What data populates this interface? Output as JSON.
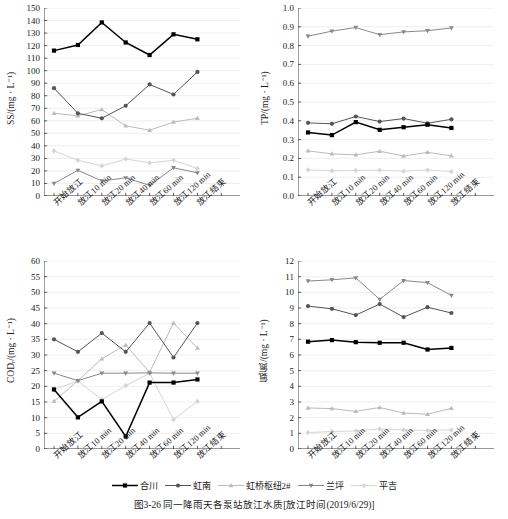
{
  "figure": {
    "caption": "图3-26  同一降雨天各泵站放江水质[放江时间(2019/6/29)]"
  },
  "legend": {
    "position": "bottom",
    "items": [
      {
        "label": "合川",
        "color": "#000000",
        "marker": "square"
      },
      {
        "label": "虹南",
        "color": "#555555",
        "marker": "circle"
      },
      {
        "label": "虹桥枢纽2#",
        "color": "#bbbbbb",
        "marker": "triangle-up"
      },
      {
        "label": "兰坪",
        "color": "#888888",
        "marker": "triangle-down"
      },
      {
        "label": "平吉",
        "color": "#d5d5d5",
        "marker": "diamond"
      }
    ]
  },
  "categories": [
    "开始放江",
    "放江10 min",
    "放江20 min",
    "放江40 min",
    "放江60 min",
    "放江120 min",
    "放江结束"
  ],
  "chart_data": [
    {
      "id": "ss",
      "type": "line",
      "title": "",
      "xlabel": "",
      "ylabel": "SS/(mg · L⁻¹)",
      "ylim": [
        0,
        150
      ],
      "yticks": [
        0,
        10,
        20,
        30,
        40,
        50,
        60,
        70,
        80,
        90,
        100,
        110,
        120,
        130,
        140,
        150
      ],
      "grid": true,
      "categories": [
        "开始放江",
        "放江10 min",
        "放江20 min",
        "放江40 min",
        "放江60 min",
        "放江120 min",
        "放江结束"
      ],
      "series": [
        {
          "name": "合川",
          "color": "#000000",
          "marker": "square",
          "values": [
            116,
            120.5,
            138.5,
            122.5,
            112.5,
            129,
            125
          ]
        },
        {
          "name": "虹南",
          "color": "#555555",
          "marker": "circle",
          "values": [
            86,
            66,
            62,
            72,
            89,
            81,
            99
          ]
        },
        {
          "name": "虹桥枢纽2#",
          "color": "#bbbbbb",
          "marker": "triangle-up",
          "values": [
            66,
            64,
            69,
            56,
            52.5,
            59,
            62
          ]
        },
        {
          "name": "兰坪",
          "color": "#888888",
          "marker": "triangle-down",
          "values": [
            10,
            20.5,
            12,
            14.5,
            8.5,
            22.5,
            18.5
          ]
        },
        {
          "name": "平吉",
          "color": "#d5d5d5",
          "marker": "diamond",
          "values": [
            36,
            28.5,
            24,
            29.5,
            26.5,
            28.5,
            22
          ]
        }
      ]
    },
    {
      "id": "tp",
      "type": "line",
      "title": "",
      "xlabel": "",
      "ylabel": "TP/(mg · L⁻¹)",
      "ylim": [
        0.0,
        1.0
      ],
      "yticks": [
        0.0,
        0.1,
        0.2,
        0.3,
        0.4,
        0.5,
        0.6,
        0.7,
        0.8,
        0.9,
        1.0
      ],
      "grid": true,
      "categories": [
        "开始放江",
        "放江10 min",
        "放江20 min",
        "放江40 min",
        "放江60 min",
        "放江120 min",
        "放江结束"
      ],
      "series": [
        {
          "name": "合川",
          "color": "#000000",
          "marker": "square",
          "values": [
            0.338,
            0.324,
            0.393,
            0.352,
            0.366,
            0.379,
            0.362
          ]
        },
        {
          "name": "虹南",
          "color": "#555555",
          "marker": "circle",
          "values": [
            0.389,
            0.384,
            0.423,
            0.396,
            0.412,
            0.387,
            0.408
          ]
        },
        {
          "name": "虹桥枢纽2#",
          "color": "#bbbbbb",
          "marker": "triangle-up",
          "values": [
            0.24,
            0.224,
            0.219,
            0.238,
            0.213,
            0.232,
            0.214
          ]
        },
        {
          "name": "兰坪",
          "color": "#888888",
          "marker": "triangle-down",
          "values": [
            0.85,
            0.877,
            0.896,
            0.858,
            0.873,
            0.879,
            0.894
          ]
        },
        {
          "name": "平吉",
          "color": "#d5d5d5",
          "marker": "diamond",
          "values": [
            0.139,
            0.134,
            0.136,
            0.137,
            0.132,
            0.138,
            0.13
          ]
        }
      ]
    },
    {
      "id": "cod",
      "type": "line",
      "title": "",
      "xlabel": "",
      "ylabel": "COD₝ᵣ/(mg · L⁻¹)",
      "ylim": [
        0,
        60
      ],
      "yticks": [
        0,
        5,
        10,
        15,
        20,
        25,
        30,
        35,
        40,
        45,
        50,
        55,
        60
      ],
      "grid": true,
      "categories": [
        "开始放江",
        "放江10 min",
        "放江20 min",
        "放江40 min",
        "放江60 min",
        "放江120 min",
        "放江结束"
      ],
      "series": [
        {
          "name": "合川",
          "color": "#000000",
          "marker": "square",
          "values": [
            19,
            10.1,
            15.2,
            4.0,
            21.2,
            21.2,
            22.2
          ]
        },
        {
          "name": "虹南",
          "color": "#555555",
          "marker": "circle",
          "values": [
            35,
            31,
            37,
            31,
            40.2,
            29.2,
            40.2
          ]
        },
        {
          "name": "虹桥枢纽2#",
          "color": "#bbbbbb",
          "marker": "triangle-up",
          "values": [
            15.2,
            21.8,
            28.8,
            33.2,
            24.5,
            40.2,
            32.2
          ]
        },
        {
          "name": "兰坪",
          "color": "#888888",
          "marker": "triangle-down",
          "values": [
            24.2,
            21.8,
            24.2,
            24.2,
            24.3,
            24.2,
            24.2
          ]
        },
        {
          "name": "平吉",
          "color": "#d5d5d5",
          "marker": "diamond",
          "values": [
            19,
            21.7,
            15.8,
            20.2,
            24.2,
            9.4,
            15.2
          ]
        }
      ]
    },
    {
      "id": "nh3n",
      "type": "line",
      "title": "",
      "xlabel": "",
      "ylabel": "氨氮/(mg · L⁻¹)",
      "ylim": [
        0,
        12
      ],
      "yticks": [
        0,
        1,
        2,
        3,
        4,
        5,
        6,
        7,
        8,
        9,
        10,
        11,
        12
      ],
      "grid": true,
      "categories": [
        "开始放江",
        "放江10 min",
        "放江20 min",
        "放江40 min",
        "放江60 min",
        "放江120 min",
        "放江结束"
      ],
      "series": [
        {
          "name": "合川",
          "color": "#000000",
          "marker": "square",
          "values": [
            6.85,
            6.95,
            6.82,
            6.78,
            6.78,
            6.35,
            6.45
          ]
        },
        {
          "name": "虹南",
          "color": "#555555",
          "marker": "circle",
          "values": [
            9.12,
            8.95,
            8.55,
            9.25,
            8.42,
            9.05,
            8.68
          ]
        },
        {
          "name": "虹桥枢纽2#",
          "color": "#bbbbbb",
          "marker": "triangle-up",
          "values": [
            2.62,
            2.58,
            2.4,
            2.65,
            2.3,
            2.22,
            2.6
          ]
        },
        {
          "name": "兰坪",
          "color": "#888888",
          "marker": "triangle-down",
          "values": [
            10.72,
            10.8,
            10.92,
            9.55,
            10.75,
            10.62,
            9.8
          ]
        },
        {
          "name": "平吉",
          "color": "#d5d5d5",
          "marker": "diamond",
          "values": [
            1.05,
            1.12,
            1.15,
            1.28,
            1.22,
            1.18,
            1.22
          ]
        }
      ]
    }
  ]
}
